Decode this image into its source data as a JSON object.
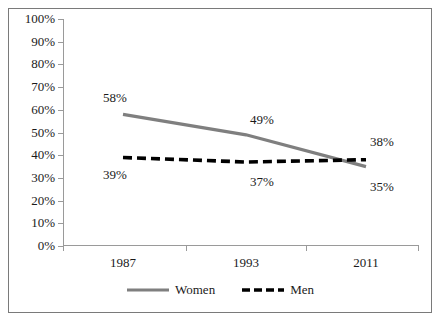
{
  "chart_data": {
    "type": "line",
    "title": "",
    "subtitle": "",
    "xlabel": "",
    "ylabel": "",
    "categories": [
      "1987",
      "1993",
      "2011"
    ],
    "series": [
      {
        "name": "Women",
        "values": [
          58,
          49,
          35
        ],
        "labels": [
          "58%",
          "49%",
          "35%"
        ],
        "style": "solid",
        "color": "#7f7f7f"
      },
      {
        "name": "Men",
        "values": [
          39,
          37,
          38
        ],
        "labels": [
          "39%",
          "37%",
          "38%"
        ],
        "style": "dashed",
        "color": "#000000"
      }
    ],
    "ylim": [
      0,
      100
    ],
    "ytick_labels": [
      "100%",
      "90%",
      "80%",
      "70%",
      "60%",
      "50%",
      "40%",
      "30%",
      "20%",
      "10%",
      "0%"
    ],
    "ytick_values": [
      100,
      90,
      80,
      70,
      60,
      50,
      40,
      30,
      20,
      10,
      0
    ],
    "grid": false,
    "legend_position": "bottom"
  },
  "legend": {
    "entries": [
      {
        "label": "Women"
      },
      {
        "label": "Men"
      }
    ]
  }
}
